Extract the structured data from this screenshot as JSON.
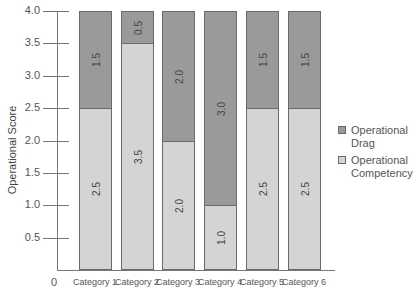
{
  "chart_data": {
    "type": "bar",
    "stacked": true,
    "title": "",
    "xlabel": "",
    "ylabel": "Operational Score",
    "ylim": [
      0,
      4.0
    ],
    "yticks": [
      "0.5",
      "1.0",
      "1.5",
      "2.0",
      "2.5",
      "3.0",
      "3.5",
      "4.0"
    ],
    "zero_label": "0",
    "categories": [
      "Category 1",
      "Category 2",
      "Category 3",
      "Category 4",
      "Category 5",
      "Category 6"
    ],
    "series": [
      {
        "name": "Operational Competency",
        "color": "#d4d4d4",
        "values": [
          2.5,
          3.5,
          2.0,
          1.0,
          2.5,
          2.5
        ],
        "labels": [
          "2.5",
          "3.5",
          "2.0",
          "1.0",
          "2.5",
          "2.5"
        ]
      },
      {
        "name": "Operational Drag",
        "color": "#9a9a9a",
        "values": [
          1.5,
          0.5,
          2.0,
          3.0,
          1.5,
          1.5
        ],
        "labels": [
          "1.5",
          "0.5",
          "2.0",
          "3.0",
          "1.5",
          "1.5"
        ]
      }
    ],
    "legend": {
      "position": "right",
      "items": [
        {
          "line1": "Operational",
          "line2": "Drag",
          "color": "#9a9a9a"
        },
        {
          "line1": "Operational",
          "line2": "Competency",
          "color": "#d4d4d4"
        }
      ]
    },
    "grid": false
  }
}
